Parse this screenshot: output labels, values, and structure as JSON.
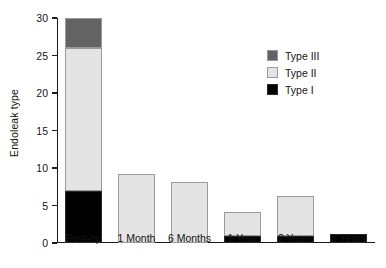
{
  "chart_data": {
    "type": "bar",
    "subtype": "stacked-bar",
    "title": "",
    "xlabel": "",
    "ylabel": "Endoleak type",
    "categories": [
      "Post-op",
      "1 Month",
      "6 Months",
      "1 Year",
      "2 Years",
      "3 Years"
    ],
    "series": [
      {
        "name": "Type I",
        "color": "#000000",
        "values": [
          7,
          0,
          0,
          1,
          1,
          1.2
        ]
      },
      {
        "name": "Type II",
        "color": "#e4e4e4",
        "values": [
          19,
          9.2,
          8.2,
          3.2,
          5.3,
          0
        ]
      },
      {
        "name": "Type III",
        "color": "#636363",
        "values": [
          4,
          0,
          0,
          0,
          0,
          0
        ]
      }
    ],
    "totals": [
      30,
      9.2,
      8.2,
      4.2,
      6.3,
      1.2
    ],
    "ylim": [
      0,
      30
    ],
    "yticks": [
      0,
      5,
      10,
      15,
      20,
      25,
      30
    ],
    "ytick_labels": [
      "0",
      "5",
      "10",
      "15",
      "20",
      "25",
      "30"
    ],
    "grid": false,
    "legend_position": "upper right",
    "legend_order": [
      "Type III",
      "Type II",
      "Type I"
    ]
  }
}
